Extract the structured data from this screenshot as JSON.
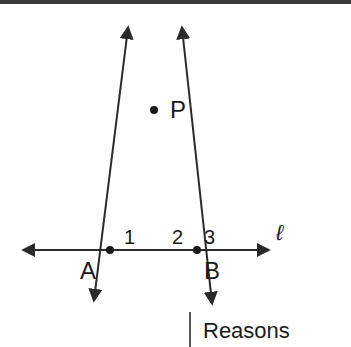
{
  "figure": {
    "labels": {
      "point_p": "P",
      "point_a": "A",
      "point_b": "B",
      "angle_1": "1",
      "angle_2": "2",
      "angle_3": "3",
      "line_l": "ℓ"
    },
    "colors": {
      "stroke": "#2a2a2a",
      "text": "#1a1a1a"
    }
  },
  "table": {
    "column_header": "Reasons"
  }
}
